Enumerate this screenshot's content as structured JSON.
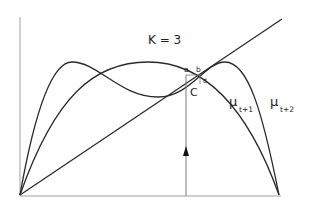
{
  "diagram": {
    "title": "K = 3",
    "point_labels": {
      "a": "a",
      "b": "b",
      "c": "c",
      "C": "C"
    },
    "curve_labels": {
      "first": {
        "symbol": "μ",
        "subscript": "t+1"
      },
      "second": {
        "symbol": "μ",
        "subscript": "t+2"
      }
    },
    "colors": {
      "line": "#2a2a2a",
      "axis": "#9a9a9a",
      "guide": "#7a7a7a"
    }
  }
}
